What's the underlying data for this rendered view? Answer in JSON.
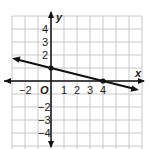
{
  "chart_data": {
    "type": "line",
    "title": "",
    "xlabel": "x",
    "ylabel": "y",
    "origin_label": "O",
    "xlim": [
      -3,
      7
    ],
    "ylim": [
      -5,
      5
    ],
    "grid": true,
    "x_ticks": [
      "−2",
      "1",
      "2",
      "3",
      "4"
    ],
    "y_ticks": [
      "4",
      "3",
      "2",
      "−2",
      "−3",
      "−4"
    ],
    "series": [
      {
        "name": "line",
        "equation": "y = -1/4 x + 1",
        "slope": -0.25,
        "intercept": 1,
        "points": [
          {
            "x": 0,
            "y": 1
          },
          {
            "x": 4,
            "y": 0
          }
        ],
        "arrows_both_ends": true
      }
    ]
  }
}
